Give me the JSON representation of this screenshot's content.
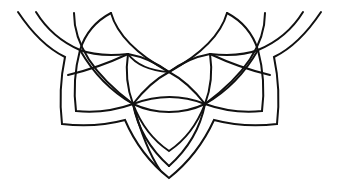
{
  "artwork": {
    "description": "Half mandala line art ornament",
    "stroke_color": "#111111",
    "background_color": "#ffffff"
  }
}
